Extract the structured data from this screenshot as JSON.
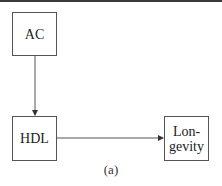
{
  "diagram": {
    "caption": "(a)",
    "nodes": [
      {
        "id": "ac",
        "label": "AC"
      },
      {
        "id": "hdl",
        "label": "HDL"
      },
      {
        "id": "longevity",
        "label": "Lon-\ngevity"
      }
    ],
    "edges": [
      {
        "from": "AC",
        "to": "HDL"
      },
      {
        "from": "HDL",
        "to": "Longevity"
      }
    ]
  },
  "colors": {
    "line": "#555555",
    "text": "#222222",
    "background": "#ffffff",
    "top_rule": "#3a3a3a"
  }
}
